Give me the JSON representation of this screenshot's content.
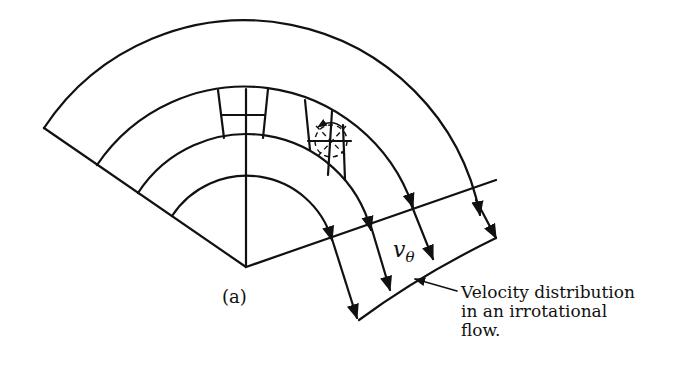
{
  "figure": {
    "panel_label": "(a)",
    "velocity_symbol": "v",
    "velocity_subscript": "θ",
    "caption_lines": [
      "Velocity distribution",
      "in an irrotational",
      "flow."
    ]
  },
  "geometry": {
    "center": [
      246,
      267
    ],
    "arc_radii": [
      240,
      178,
      129,
      89
    ],
    "stroke_color": "#111111",
    "background": "#ffffff"
  }
}
